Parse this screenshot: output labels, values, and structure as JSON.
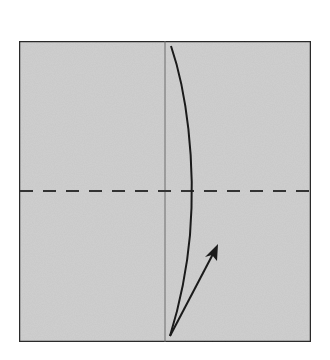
{
  "diagram": {
    "type": "origami-fold-step",
    "paper": {
      "shape": "square",
      "fill": "#d0d0d0",
      "border_color": "#2a2a2a",
      "x": 18,
      "y": 40,
      "width": 294,
      "height": 303
    },
    "creases": [
      {
        "kind": "existing-crease",
        "orientation": "vertical",
        "x": 165,
        "color": "#6a6a6a"
      }
    ],
    "fold_lines": [
      {
        "kind": "valley-fold",
        "style": "dashed",
        "orientation": "horizontal",
        "y": 191,
        "color": "#333333"
      }
    ],
    "arrows": [
      {
        "kind": "fold-arrow-curve",
        "description": "curved line from bottom center to top edge",
        "color": "#1a1a1a"
      },
      {
        "kind": "direction-arrow",
        "description": "straight arrow from bottom center pointing up-right",
        "color": "#1a1a1a"
      }
    ],
    "colors": {
      "background": "#ffffff",
      "paper": "#d0d0d0",
      "ink": "#1a1a1a"
    }
  }
}
